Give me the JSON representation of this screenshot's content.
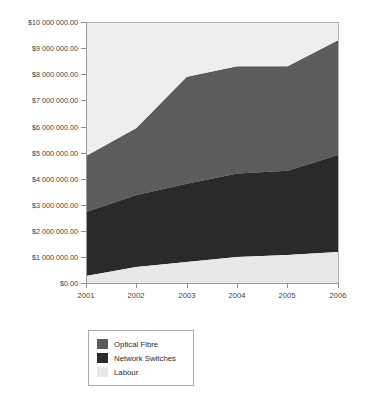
{
  "chart_data": {
    "type": "area",
    "stacked": true,
    "title": "",
    "subtitle": "",
    "xlabel": "",
    "ylabel": "",
    "categories": [
      "2001",
      "2002",
      "2003",
      "2004",
      "2005",
      "2006"
    ],
    "x": [
      2001,
      2002,
      2003,
      2004,
      2005,
      2006
    ],
    "series": [
      {
        "name": "Labour",
        "color": "#e8e8e8",
        "values": [
          270000,
          610000,
          800000,
          1000000,
          1070000,
          1190000
        ]
      },
      {
        "name": "Network Switches",
        "color": "#2a2a2a",
        "values": [
          2450000,
          2760000,
          3000000,
          3200000,
          3230000,
          3710000
        ]
      },
      {
        "name": "Optical Fibre",
        "color": "#5c5c5c",
        "values": [
          2150000,
          2570000,
          4100000,
          4100000,
          4000000,
          4400000
        ]
      }
    ],
    "cumulative_tops": {
      "Labour": [
        270000,
        610000,
        800000,
        1000000,
        1070000,
        1190000
      ],
      "Network Switches": [
        2720000,
        3370000,
        3800000,
        4200000,
        4300000,
        4900000
      ],
      "Optical Fibre": [
        4870000,
        5940000,
        7900000,
        8300000,
        8300000,
        9300000
      ]
    },
    "ylim": [
      0,
      10000000
    ],
    "ytick_values": [
      0,
      1000000,
      2000000,
      3000000,
      4000000,
      5000000,
      6000000,
      7000000,
      8000000,
      9000000,
      10000000
    ],
    "ytick_labels": [
      "$0.00",
      "$1 000 000.00",
      "$2 000 000.00",
      "$3 000 000.00",
      "$4 000 000.00",
      "$5 000 000.00",
      "$6 000 000.00",
      "$7 000 000.00",
      "$8 000 000.00",
      "$9 000 000.00",
      "$10 000 000.00"
    ],
    "grid": false,
    "legend_position": "bottom-left",
    "legend_entries": [
      {
        "label": "Optical Fibre",
        "color": "#5c5c5c"
      },
      {
        "label": "Network Switches",
        "color": "#2a2a2a"
      },
      {
        "label": "Labour",
        "color": "#e8e8e8"
      }
    ]
  },
  "axes": {
    "y_labels": {
      "t10": "$10 000 000.00",
      "t9": "$9 000 000.00",
      "t8": "$8 000 000.00",
      "t7": "$7 000 000.00",
      "t6": "$6 000 000.00",
      "t5": "$5 000 000.00",
      "t4": "$4 000 000.00",
      "t3": "$3 000 000.00",
      "t2": "$2 000 000.00",
      "t1": "$1 000 000.00",
      "t0": "$0.00"
    },
    "x_labels": {
      "c0": "2001",
      "c1": "2002",
      "c2": "2003",
      "c3": "2004",
      "c4": "2005",
      "c5": "2006"
    }
  },
  "legend": {
    "items": {
      "i0": "Optical Fibre",
      "i1": "Network Switches",
      "i2": "Labour"
    }
  },
  "colors": {
    "optical_fibre": "#5c5c5c",
    "network_switches": "#2a2a2a",
    "labour": "#e8e8e8",
    "axis": "#9a9a9a",
    "text": "#3f3f3f",
    "background": "#ffffff"
  }
}
